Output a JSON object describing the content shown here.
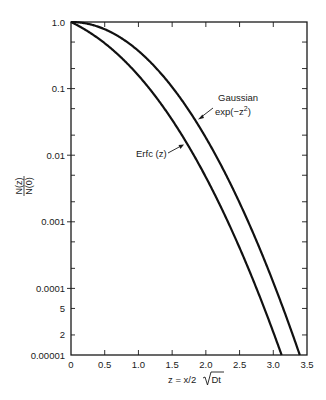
{
  "chart_data": {
    "type": "line",
    "title": "",
    "xlabel": "z = x/2√Dt",
    "xlabel_parts": {
      "prefix": "z = x/2",
      "radicand": "Dt"
    },
    "ylabel": "N(z)/N(0)",
    "ylabel_parts": {
      "numerator": "N(z)",
      "denominator": "N(0)"
    },
    "xlim": [
      0,
      3.5
    ],
    "ylim": [
      1e-05,
      1.0
    ],
    "yscale": "log",
    "grid": false,
    "legend": "annotations",
    "x_ticks": [
      0,
      0.5,
      1.0,
      1.5,
      2.0,
      2.5,
      3.0,
      3.5
    ],
    "x_tick_labels": [
      "0",
      "0.5",
      "1.0",
      "1.5",
      "2.0",
      "2.5",
      "3.0",
      "3.5"
    ],
    "y_ticks": [
      1.0,
      0.1,
      0.01,
      0.001,
      0.0001,
      5e-05,
      2e-05,
      1e-05
    ],
    "y_tick_labels": [
      "1.0",
      "0.1",
      "0.01",
      "0.001",
      "0.0001",
      "5",
      "2",
      "0.00001"
    ],
    "series": [
      {
        "name": "Gaussian exp(−z²)",
        "function": "gaussian",
        "x": [
          0,
          0.5,
          1.0,
          1.5,
          2.0,
          2.5,
          3.0,
          3.39
        ],
        "values": [
          1.0,
          0.7788,
          0.3679,
          0.1054,
          0.0183,
          0.00193,
          0.000123,
          1e-05
        ]
      },
      {
        "name": "Erfc (z)",
        "function": "erfc",
        "x": [
          0,
          0.5,
          1.0,
          1.5,
          2.0,
          2.5,
          3.0,
          3.12
        ],
        "values": [
          1.0,
          0.4795,
          0.1573,
          0.0339,
          0.00468,
          0.000407,
          2.21e-05,
          1e-05
        ]
      }
    ],
    "annotations": [
      {
        "text_lines": [
          "Gaussian",
          "exp(−z²)"
        ],
        "points_to": "Gaussian exp(−z²)"
      },
      {
        "text_lines": [
          "Erfc (z)"
        ],
        "points_to": "Erfc (z)"
      }
    ]
  }
}
